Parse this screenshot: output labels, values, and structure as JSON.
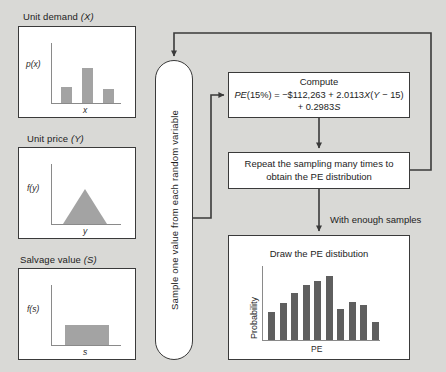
{
  "diagram": {
    "title_hidden": "",
    "background_color": "#d9d9d6",
    "line_color": "#3a3a3a",
    "fill_gray": "#a3a3a3",
    "bar_dark": "#5f5f5f"
  },
  "inputs": [
    {
      "id": "unit-demand",
      "title": "Unit demand (X)",
      "title_plain": "Unit demand ",
      "title_var": "(X)",
      "ylabel": "p(x)",
      "xlabel": "x",
      "chart_type": "bar",
      "values": [
        0.28,
        0.62,
        0.24
      ]
    },
    {
      "id": "unit-price",
      "title": "Unit price (Y)",
      "title_plain": "Unit price ",
      "title_var": "(Y)",
      "ylabel": "f(y)",
      "xlabel": "y",
      "chart_type": "triangular",
      "values": [
        0,
        1,
        0
      ]
    },
    {
      "id": "salvage-value",
      "title": "Salvage value (S)",
      "title_plain": "Salvage value ",
      "title_var": "(S)",
      "ylabel": "f(s)",
      "xlabel": "s",
      "chart_type": "uniform",
      "values": [
        0.45,
        0.45
      ]
    }
  ],
  "capsule": {
    "label": "Sample one value from each random variable"
  },
  "compute": {
    "heading": "Compute",
    "formula_line1_a": "PE",
    "formula_line1_b": "(15%) = −$112,263 + 2.0113",
    "formula_line1_x": "X",
    "formula_line1_c": "(",
    "formula_line1_y": "Y",
    "formula_line1_d": " − 15)",
    "formula_line2_a": "+ 0.2983",
    "formula_line2_s": "S",
    "formula_plain": "PE(15%) = −$112,263 + 2.0113X(Y − 15) + 0.2983S"
  },
  "repeat": {
    "line1": "Repeat the sampling many times to",
    "line2": "obtain the PE distribution"
  },
  "with_enough": {
    "label": "With enough samples"
  },
  "chart_data": {
    "type": "bar",
    "title": "Draw the PE distibution",
    "xlabel": "PE",
    "ylabel": "Probability",
    "categories": [
      "1",
      "2",
      "3",
      "4",
      "5",
      "6",
      "7",
      "8",
      "9",
      "10"
    ],
    "values": [
      0.38,
      0.5,
      0.64,
      0.74,
      0.8,
      0.87,
      0.42,
      0.52,
      0.47,
      0.24
    ],
    "ylim": [
      0,
      1
    ],
    "grid": false,
    "legend": "none"
  }
}
